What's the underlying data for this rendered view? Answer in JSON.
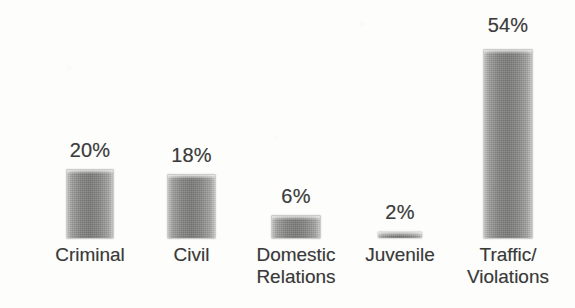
{
  "chart_data": {
    "type": "bar",
    "title": "",
    "subtitle": "",
    "xlabel": "",
    "ylabel": "",
    "ylim": [
      0,
      60
    ],
    "grid": false,
    "legend": null,
    "value_suffix": "%",
    "categories": [
      "Criminal",
      "Civil",
      "Domestic Relations",
      "Juvenile",
      "Traffic/ Violations"
    ],
    "values": [
      20,
      18,
      6,
      2,
      54
    ],
    "value_labels": [
      "20%",
      "18%",
      "6%",
      "2%",
      "54%"
    ],
    "bars": [
      {
        "name": "criminal",
        "value": 20,
        "value_label": "20%",
        "label_lines": [
          "Criminal"
        ]
      },
      {
        "name": "civil",
        "value": 18,
        "value_label": "18%",
        "label_lines": [
          "Civil"
        ]
      },
      {
        "name": "domestic-relations",
        "value": 6,
        "value_label": "6%",
        "label_lines": [
          "Domestic",
          "Relations"
        ]
      },
      {
        "name": "juvenile",
        "value": 2,
        "value_label": "2%",
        "label_lines": [
          "Juvenile"
        ]
      },
      {
        "name": "traffic-violations",
        "value": 54,
        "value_label": "54%",
        "label_lines": [
          "Traffic/",
          "Violations"
        ]
      }
    ]
  },
  "style": {
    "background_color": "#fdfdfc",
    "bar_color": "#80807e",
    "bar_edge_color": "#c9c9c7",
    "text_color": "#3a3a3a"
  },
  "layout": {
    "baseline_y": 238,
    "bar_geometry": [
      {
        "left": 67,
        "width": 46,
        "top": 170,
        "height": 68,
        "value_label_top": 139,
        "label_top": 244
      },
      {
        "left": 168,
        "width": 47,
        "top": 175,
        "height": 63,
        "value_label_top": 144,
        "label_top": 244
      },
      {
        "left": 272,
        "width": 48,
        "top": 216,
        "height": 22,
        "value_label_top": 185,
        "label_top": 244
      },
      {
        "left": 378,
        "width": 44,
        "top": 232,
        "height": 6,
        "value_label_top": 201,
        "label_top": 244
      },
      {
        "left": 484,
        "width": 48,
        "top": 50,
        "height": 188,
        "value_label_top": 14,
        "label_top": 244
      }
    ],
    "value_label_box_width": 92,
    "category_label_box_width": 130
  }
}
